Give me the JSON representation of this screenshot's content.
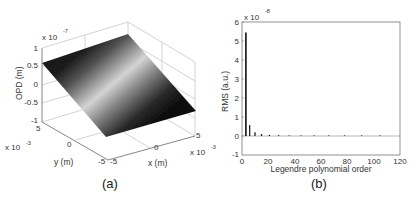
{
  "chart_data": [
    {
      "type": "surface",
      "panel_label": "(a)",
      "title": "",
      "xlabel": "x (m)",
      "ylabel": "y (m)",
      "zlabel": "OPD (m)",
      "x_ticks": [
        "-5",
        "0",
        "5"
      ],
      "x_multiplier": "x 10",
      "x_exponent": "-3",
      "y_ticks": [
        "-5",
        "0",
        "5"
      ],
      "y_multiplier": "x 10",
      "y_exponent": "-3",
      "z_ticks": [
        "-1",
        "-0.5",
        "0",
        "0.5",
        "1"
      ],
      "z_multiplier": "x 10",
      "z_exponent": "-7",
      "xlim": [
        -0.005,
        0.005
      ],
      "ylim": [
        -0.005,
        0.005
      ],
      "zlim": [
        -1e-07,
        1e-07
      ],
      "description": "Tilted grayscale surface (plane) with a light band through the middle, dark at both edges, noisy texture",
      "grid": true
    },
    {
      "type": "bar",
      "panel_label": "(b)",
      "title": "",
      "xlabel": "Legendre polynomial order",
      "ylabel": "RMS (a.u.)",
      "y_multiplier": "x 10",
      "y_exponent": "-8",
      "x_ticks": [
        "0",
        "20",
        "40",
        "60",
        "80",
        "100",
        "120"
      ],
      "y_ticks": [
        "-1",
        "0",
        "1",
        "2",
        "3",
        "4",
        "5",
        "6"
      ],
      "xlim": [
        0,
        120
      ],
      "ylim": [
        -1,
        6
      ],
      "grid": false,
      "x": [
        3,
        6,
        10,
        15,
        21,
        28,
        36,
        45,
        55,
        66,
        78,
        91,
        105
      ],
      "values": [
        5.45,
        0.58,
        0.2,
        0.1,
        0.06,
        0.04,
        0.03,
        0.02,
        0.02,
        0.015,
        0.01,
        0.01,
        0.01
      ]
    }
  ]
}
